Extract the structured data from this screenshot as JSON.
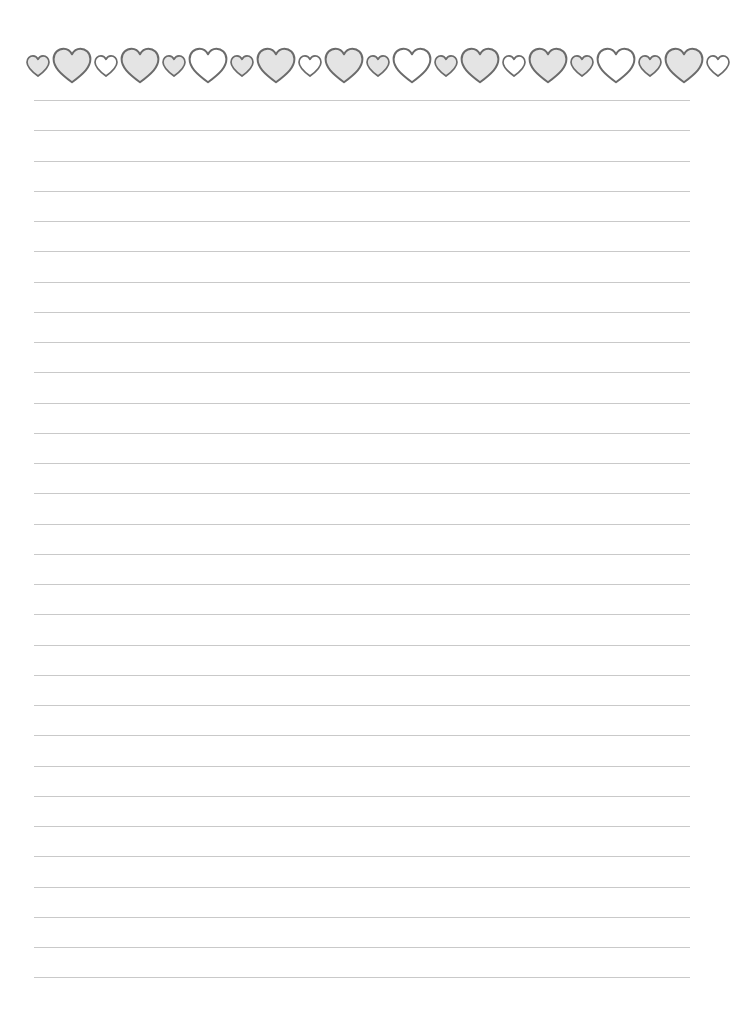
{
  "document": {
    "type": "lined-writing-paper",
    "background_color": "#ffffff"
  },
  "border": {
    "motif": "hearts",
    "stroke_color": "#6b6b6b",
    "fill_gray": "#e4e4e4",
    "fill_white": "#ffffff",
    "hearts": [
      {
        "size": "small",
        "fill": "gray"
      },
      {
        "size": "big",
        "fill": "gray"
      },
      {
        "size": "small",
        "fill": "white"
      },
      {
        "size": "big",
        "fill": "gray"
      },
      {
        "size": "small",
        "fill": "gray"
      },
      {
        "size": "big",
        "fill": "white"
      },
      {
        "size": "small",
        "fill": "gray"
      },
      {
        "size": "big",
        "fill": "gray"
      },
      {
        "size": "small",
        "fill": "white"
      },
      {
        "size": "big",
        "fill": "gray"
      },
      {
        "size": "small",
        "fill": "gray"
      },
      {
        "size": "big",
        "fill": "white"
      },
      {
        "size": "small",
        "fill": "gray"
      },
      {
        "size": "big",
        "fill": "gray"
      },
      {
        "size": "small",
        "fill": "white"
      },
      {
        "size": "big",
        "fill": "gray"
      },
      {
        "size": "small",
        "fill": "gray"
      },
      {
        "size": "big",
        "fill": "white"
      },
      {
        "size": "small",
        "fill": "gray"
      },
      {
        "size": "big",
        "fill": "gray"
      },
      {
        "size": "small",
        "fill": "white"
      }
    ]
  },
  "ruled_lines": {
    "count": 30,
    "first_y": 100,
    "spacing": 30.25,
    "x_start": 34,
    "x_end": 690,
    "color": "#c9c9c9"
  }
}
